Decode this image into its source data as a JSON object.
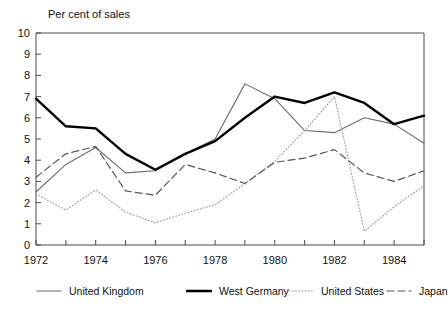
{
  "chart_data": {
    "type": "line",
    "title": "Per cent of sales",
    "xlabel": "",
    "ylabel": "Per cent of sales",
    "xlim": [
      1972,
      1985
    ],
    "ylim": [
      0,
      10
    ],
    "grid": false,
    "legend_position": "bottom",
    "x": [
      1972,
      1973,
      1974,
      1975,
      1976,
      1977,
      1978,
      1979,
      1980,
      1981,
      1982,
      1983,
      1984,
      1985
    ],
    "xtick_labels": [
      "1972",
      "1974",
      "1976",
      "1978",
      "1980",
      "1982",
      "1984"
    ],
    "xtick_values": [
      1972,
      1974,
      1976,
      1978,
      1980,
      1982,
      1984
    ],
    "xtick_minor_values": [
      1973,
      1975,
      1977,
      1979,
      1981,
      1983,
      1985
    ],
    "ytick_labels": [
      "0",
      "1",
      "2",
      "3",
      "4",
      "5",
      "6",
      "7",
      "8",
      "9",
      "10"
    ],
    "ytick_values": [
      0,
      1,
      2,
      3,
      4,
      5,
      6,
      7,
      8,
      9,
      10
    ],
    "series": [
      {
        "name": "United Kingdom",
        "style": "thin-solid",
        "color": "#6b6b6b",
        "width": 1.1,
        "dash": "",
        "values": [
          2.5,
          3.8,
          4.6,
          3.4,
          3.5,
          4.3,
          5.0,
          7.6,
          6.9,
          5.4,
          5.3,
          6.0,
          5.7,
          4.8
        ]
      },
      {
        "name": "West Germany",
        "style": "thick-solid",
        "color": "#000000",
        "width": 2.4,
        "dash": "",
        "values": [
          6.9,
          5.6,
          5.5,
          4.3,
          3.55,
          4.3,
          4.9,
          6.0,
          7.0,
          6.7,
          7.2,
          6.7,
          5.7,
          6.1
        ]
      },
      {
        "name": "United States",
        "style": "dotted",
        "color": "#9a9a9a",
        "width": 1.1,
        "dash": "1,2.2",
        "values": [
          2.4,
          1.65,
          2.6,
          1.55,
          1.05,
          1.5,
          1.9,
          2.9,
          3.95,
          5.4,
          7.0,
          0.65,
          1.8,
          2.8
        ]
      },
      {
        "name": "Japan",
        "style": "dashed",
        "color": "#555555",
        "width": 1.2,
        "dash": "7,4",
        "values": [
          3.2,
          4.3,
          4.65,
          2.55,
          2.35,
          3.8,
          3.4,
          2.9,
          3.9,
          4.1,
          4.5,
          3.4,
          3.0,
          3.5
        ]
      }
    ]
  },
  "legend": {
    "items": [
      {
        "label": "United Kingdom"
      },
      {
        "label": "West Germany"
      },
      {
        "label": "United States"
      },
      {
        "label": "Japan"
      }
    ]
  }
}
